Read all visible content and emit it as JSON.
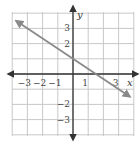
{
  "chart_data": {
    "type": "line",
    "title": "",
    "xlabel": "x",
    "ylabel": "y",
    "xlim": [
      -4,
      4
    ],
    "ylim": [
      -4,
      4
    ],
    "grid": true,
    "x_ticks": [
      {
        "value": -3,
        "label": "−3"
      },
      {
        "value": -2,
        "label": "−2"
      },
      {
        "value": -1,
        "label": "−1"
      },
      {
        "value": 1,
        "label": "1"
      },
      {
        "value": 3,
        "label": "3"
      }
    ],
    "y_ticks": [
      {
        "value": 3,
        "label": "3"
      },
      {
        "value": 2,
        "label": "2"
      },
      {
        "value": -2,
        "label": "−2"
      },
      {
        "value": -3,
        "label": "−3"
      }
    ],
    "series": [
      {
        "name": "line",
        "equation": "y = -2/3 x + 1",
        "x": [
          -3.75,
          3.75
        ],
        "y": [
          3.5,
          -1.5
        ],
        "arrows": "both",
        "color": "#8a8a8a"
      }
    ]
  }
}
